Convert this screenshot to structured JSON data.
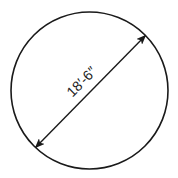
{
  "diagram": {
    "shape": "circle",
    "dimension_label": "18′-6″",
    "dimension_type": "diameter",
    "colors": {
      "stroke": "#1a1a1a",
      "background": "#ffffff"
    }
  }
}
